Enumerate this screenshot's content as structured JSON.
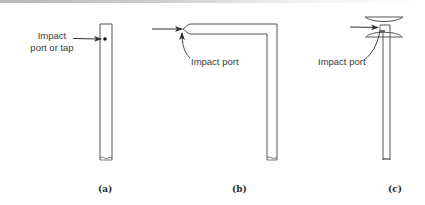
{
  "figure": {
    "panels": [
      {
        "id": "a",
        "caption": "(a)",
        "label_line1": "Impact",
        "label_line2": "port or tap",
        "description": "Straight tube with side impact port/tap facing the flow arrow"
      },
      {
        "id": "b",
        "caption": "(b)",
        "label": "Impact port",
        "description": "L-shaped tube with open end facing the flow"
      },
      {
        "id": "c",
        "caption": "(c)",
        "label": "Impact port",
        "description": "Straight tube with shielded impact port between two curved shields"
      }
    ],
    "colors": {
      "line": "#444444",
      "text": "#3a3a3a",
      "background": "#ffffff"
    }
  }
}
